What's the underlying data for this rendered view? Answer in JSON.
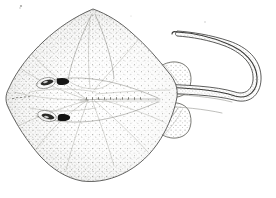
{
  "figure": {
    "view": "dorsal",
    "style": "pen-and-ink stipple scientific illustration",
    "background_color": "#ffffff",
    "ink_color": "#3a3a38",
    "stipple_color": "#5f5f59",
    "canvas": {
      "width": 276,
      "height": 198
    }
  },
  "anatomy": {
    "disc": {
      "label": "pectoral disc",
      "shape": "rhomboid with rounded posterior corners",
      "snout_apex": {
        "x": 93,
        "y": 9
      },
      "left_extent": {
        "x": 6,
        "y": 99
      },
      "right_extent": {
        "x": 178,
        "y": 96
      },
      "posterior": {
        "x": 88,
        "y": 180
      }
    },
    "snout": {
      "label": "pointed snout",
      "position": {
        "x": 93,
        "y": 9
      }
    },
    "eyes": [
      {
        "label": "left eye",
        "cx": 46,
        "cy": 83,
        "rx": 8.5,
        "ry": 3.6,
        "angle": -14
      },
      {
        "label": "right eye",
        "cx": 47,
        "cy": 116,
        "rx": 8.5,
        "ry": 3.6,
        "angle": 14
      }
    ],
    "spiracles": [
      {
        "label": "upper spiracle",
        "cx": 63,
        "cy": 81,
        "color": "#141413"
      },
      {
        "label": "lower spiracle",
        "cx": 64,
        "cy": 117,
        "color": "#141413"
      }
    ],
    "pelvic_fins": [
      {
        "label": "upper pelvic fin",
        "cx": 172,
        "cy": 73
      },
      {
        "label": "lower pelvic fin",
        "cx": 172,
        "cy": 128
      }
    ],
    "tail": {
      "label": "long tapering tail",
      "base": {
        "x": 160,
        "y": 100
      },
      "direction": "extends right then curves upward and back to the left",
      "tip": {
        "x": 176,
        "y": 33
      },
      "turn_apex": {
        "x": 258,
        "y": 60
      }
    },
    "midline_ridge": {
      "label": "dorsal midline ridge",
      "from": {
        "x": 80,
        "y": 100
      },
      "to": {
        "x": 165,
        "y": 100
      }
    }
  },
  "stipple": {
    "label": "stipple shading",
    "description": "dense dots along disc margins fading toward the pale center",
    "edge_density": "high",
    "center_density": "low"
  },
  "labels": {
    "caption": ""
  }
}
